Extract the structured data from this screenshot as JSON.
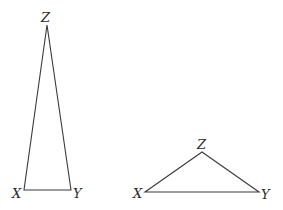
{
  "diagram": {
    "type": "two triangles",
    "triangles": [
      {
        "id": "tall",
        "vertices": {
          "X": {
            "label": "X",
            "x": 24,
            "y": 190
          },
          "Y": {
            "label": "Y",
            "x": 71,
            "y": 190
          },
          "Z": {
            "label": "Z",
            "x": 47,
            "y": 25
          }
        }
      },
      {
        "id": "wide",
        "vertices": {
          "X": {
            "label": "X",
            "x": 145,
            "y": 192
          },
          "Y": {
            "label": "Y",
            "x": 259,
            "y": 192
          },
          "Z": {
            "label": "Z",
            "x": 202,
            "y": 152
          }
        }
      }
    ],
    "stroke_color": "#3a3a3a"
  }
}
